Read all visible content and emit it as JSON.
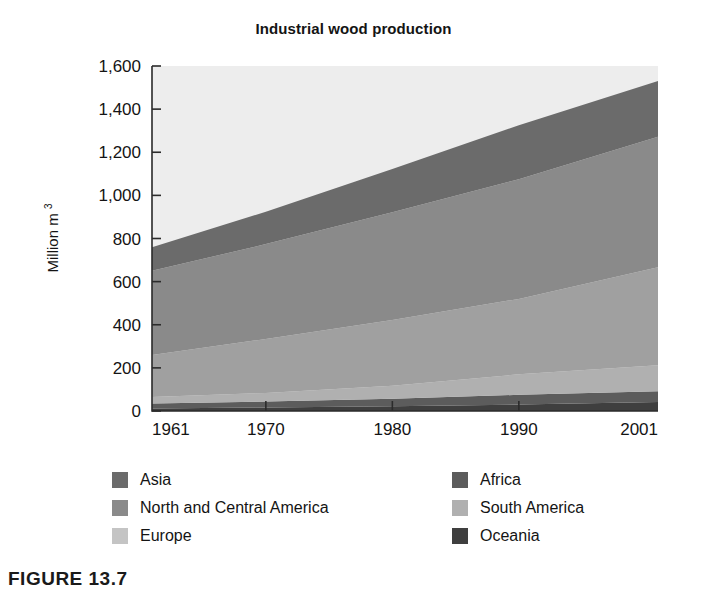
{
  "figure": {
    "caption": "FIGURE 13.7"
  },
  "chart_data": {
    "type": "area",
    "title": "Industrial wood production",
    "xlabel": "",
    "ylabel": "Million m 3",
    "ylabel_main": "Million m",
    "ylabel_superscript": "3",
    "x": [
      1961,
      1970,
      1980,
      1990,
      2001
    ],
    "xlim": [
      1961,
      2001
    ],
    "ylim": [
      0,
      1600
    ],
    "xticks": [
      "1961",
      "1970",
      "1980",
      "1990",
      "2001"
    ],
    "yticks": [
      "0",
      "200",
      "400",
      "600",
      "800",
      "1,000",
      "1,200",
      "1,400",
      "1,600"
    ],
    "ytick_values": [
      0,
      200,
      400,
      600,
      800,
      1000,
      1200,
      1400,
      1600
    ],
    "grid": false,
    "legend_position": "below",
    "stacking_order_bottom_to_top": [
      "Oceania",
      "Africa",
      "South America",
      "Europe",
      "North and Central America",
      "Asia"
    ],
    "series": [
      {
        "name": "Oceania",
        "color": "#3f3f3f",
        "values": [
          12,
          16,
          22,
          30,
          42
        ]
      },
      {
        "name": "Africa",
        "color": "#5c5c5c",
        "values": [
          23,
          28,
          35,
          45,
          50
        ]
      },
      {
        "name": "South America",
        "color": "#b0b0b0",
        "values": [
          30,
          40,
          60,
          95,
          120
        ]
      },
      {
        "name": "Europe",
        "color": "#a0a0a0",
        "values": [
          195,
          250,
          305,
          350,
          455
        ]
      },
      {
        "name": "North and Central America",
        "color": "#8a8a8a",
        "values": [
          390,
          440,
          500,
          555,
          605
        ]
      },
      {
        "name": "Asia",
        "color": "#6b6b6b",
        "values": [
          110,
          150,
          200,
          250,
          258
        ]
      }
    ],
    "totals": [
      760,
      924,
      1122,
      1325,
      1530
    ],
    "legend": [
      {
        "name": "Asia",
        "color": "#6b6b6b",
        "column": "left",
        "row": 0
      },
      {
        "name": "North and Central America",
        "color": "#8a8a8a",
        "column": "left",
        "row": 1
      },
      {
        "name": "Europe",
        "color": "#c4c4c4",
        "column": "left",
        "row": 2
      },
      {
        "name": "Africa",
        "color": "#5c5c5c",
        "column": "right",
        "row": 0
      },
      {
        "name": "South America",
        "color": "#b0b0b0",
        "column": "right",
        "row": 1
      },
      {
        "name": "Oceania",
        "color": "#3f3f3f",
        "column": "right",
        "row": 2
      }
    ],
    "plot_background": "#ededed"
  }
}
